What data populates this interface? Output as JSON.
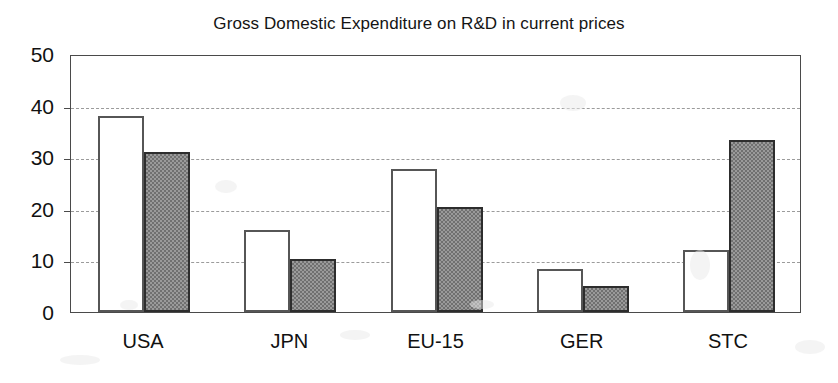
{
  "chart_data": {
    "type": "bar",
    "title": "Gross Domestic Expenditure on R&D in current prices",
    "xlabel": "",
    "ylabel": "",
    "categories": [
      "USA",
      "JPN",
      "EU-15",
      "GER",
      "STC"
    ],
    "series": [
      {
        "name": "series-1",
        "style": "white-outlined",
        "values": [
          38.0,
          15.8,
          27.8,
          8.3,
          12.0
        ]
      },
      {
        "name": "series-2",
        "style": "gray-hatched",
        "values": [
          31.0,
          10.3,
          20.3,
          5.1,
          33.3
        ]
      }
    ],
    "ylim": [
      0,
      50
    ],
    "yticks": [
      0,
      10,
      20,
      30,
      40,
      50
    ],
    "ytick_labels": [
      "0",
      "10",
      "20",
      "30",
      "40",
      "50"
    ],
    "gridlines_at": [
      10,
      20,
      30,
      40
    ],
    "grid": true,
    "legend": "none",
    "colors": {
      "series_1_fill": "#ffffff",
      "series_1_edge": "#565656",
      "series_2_fill": "#9a9a9a",
      "series_2_edge": "#2d2d2d",
      "gridline": "#9b9b9b",
      "axis": "#4a4a4a",
      "text": "#111111",
      "background": "#ffffff"
    }
  }
}
